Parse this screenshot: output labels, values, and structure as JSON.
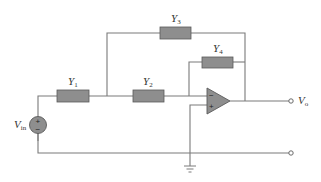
{
  "diagram": {
    "type": "op-amp circuit with admittances",
    "components": {
      "Y1": {
        "label": "Y",
        "subscript": "1"
      },
      "Y2": {
        "label": "Y",
        "subscript": "2"
      },
      "Y3": {
        "label": "Y",
        "subscript": "3"
      },
      "Y4": {
        "label": "Y",
        "subscript": "4"
      }
    },
    "source": {
      "label": "V",
      "subscript": "in",
      "plus": "+",
      "minus": "−"
    },
    "output": {
      "label": "V",
      "subscript": "o"
    },
    "opamp": {
      "inverting": "−",
      "noninverting": "+"
    },
    "colors": {
      "component_fill": "#8e8e8e",
      "wire": "#7a7a7a"
    }
  }
}
